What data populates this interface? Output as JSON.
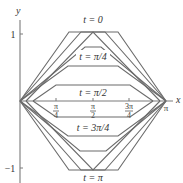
{
  "diagram": {
    "type": "wave-equation-snapshots",
    "axes": {
      "x_label": "x",
      "y_label": "y",
      "y_ticks": [
        {
          "value": 1,
          "label": "1"
        },
        {
          "value": -1,
          "label": "−1"
        }
      ],
      "x_ticks": [
        {
          "value": "π/4",
          "num": "π",
          "den": "4"
        },
        {
          "value": "π/2",
          "num": "π",
          "den": "2"
        },
        {
          "value": "3π/4",
          "num": "3π",
          "den": "4"
        }
      ],
      "x_end_label": "π"
    },
    "curve_labels": [
      {
        "t": "0",
        "text": "t = 0"
      },
      {
        "t": "π/4",
        "text": "t = π/4"
      },
      {
        "t": "π/2",
        "text": "t = π/2"
      },
      {
        "t": "3π/4",
        "text": "t = 3π/4"
      },
      {
        "t": "π",
        "text": "t = π"
      }
    ],
    "colors": {
      "curve": "#6b6b6b",
      "axis": "#7a7a7a",
      "text": "#333333"
    }
  }
}
